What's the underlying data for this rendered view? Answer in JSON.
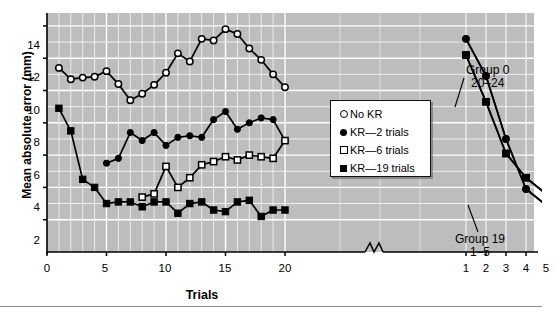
{
  "chart_data": {
    "type": "line",
    "title": "",
    "xlabel": "Trials",
    "ylabel": "Mean absolute error (mm)",
    "ylim": [
      0,
      14.8
    ],
    "yticks": [
      2,
      4,
      6,
      8,
      10,
      12,
      14
    ],
    "grid": true,
    "axis_break": true,
    "acquisition": {
      "xticks": [
        0,
        5,
        10,
        15,
        20
      ],
      "x": [
        1,
        2,
        3,
        4,
        5,
        6,
        7,
        8,
        9,
        10,
        11,
        12,
        13,
        14,
        15,
        16,
        17,
        18,
        19,
        20
      ]
    },
    "retention": {
      "xticks": [
        1,
        2,
        3,
        4,
        5
      ],
      "x": [
        1,
        2,
        3,
        4,
        5
      ]
    },
    "legend_position": "inside-right",
    "series": [
      {
        "name": "No KR",
        "marker": "open-circle",
        "acquisition": [
          11.4,
          10.7,
          10.8,
          10.85,
          11.2,
          10.4,
          9.4,
          9.8,
          10.35,
          11.1,
          12.3,
          11.8,
          13.2,
          13.1,
          13.8,
          13.5,
          12.6,
          11.9,
          11.0,
          10.2
        ],
        "retention": [
          13.2,
          10.9,
          7.0,
          3.9,
          2.9
        ]
      },
      {
        "name": "KR—2 trials",
        "marker": "filled-circle",
        "acquisition": [
          null,
          null,
          null,
          null,
          5.5,
          5.8,
          7.4,
          6.9,
          7.4,
          6.6,
          7.1,
          7.2,
          7.1,
          8.2,
          8.7,
          7.6,
          8.0,
          8.3,
          8.2,
          6.9
        ],
        "retention": [
          13.2,
          10.9,
          7.0,
          3.9,
          2.9
        ]
      },
      {
        "name": "KR—6 trials",
        "marker": "open-square",
        "acquisition": [
          null,
          null,
          null,
          null,
          null,
          null,
          null,
          3.4,
          3.6,
          5.3,
          4.0,
          4.6,
          5.4,
          5.6,
          5.9,
          5.7,
          6.0,
          5.9,
          5.8,
          6.9
        ],
        "retention": [
          12.2,
          9.3,
          6.1,
          4.6,
          3.6
        ]
      },
      {
        "name": "KR—19 trials",
        "marker": "filled-square",
        "acquisition": [
          8.9,
          7.5,
          4.5,
          4.0,
          3.0,
          3.1,
          3.1,
          2.8,
          3.1,
          3.1,
          2.4,
          3.0,
          3.1,
          2.6,
          2.5,
          3.1,
          3.2,
          2.2,
          2.6,
          2.6
        ],
        "retention": [
          12.2,
          9.3,
          6.1,
          4.6,
          3.6
        ]
      }
    ],
    "annotations": [
      {
        "id": "group-0",
        "line1": "Group 0",
        "line2": "20–24"
      },
      {
        "id": "group-19",
        "line1": "Group 19",
        "line2": "1–5"
      }
    ]
  },
  "axes": {
    "y_title": "Mean absolute error (mm)",
    "x_title": "Trials",
    "y_tick_labels": [
      "2",
      "4",
      "6",
      "8",
      "10",
      "12",
      "14"
    ],
    "x_tick_labels_left": [
      "0",
      "5",
      "10",
      "15",
      "20"
    ],
    "x_tick_labels_right": [
      "1",
      "2",
      "3",
      "4",
      "5"
    ]
  },
  "legend": {
    "items": [
      {
        "label": "No KR",
        "marker": "open-circle"
      },
      {
        "label": "KR—2 trials",
        "marker": "filled-circle"
      },
      {
        "label": "KR—6 trials",
        "marker": "open-square"
      },
      {
        "label": "KR—19 trials",
        "marker": "filled-square"
      }
    ]
  },
  "annotations": {
    "group0_line1": "Group 0",
    "group0_line2": "20–24",
    "group19_line1": "Group 19",
    "group19_line2": "1–5"
  },
  "colors": {
    "plot_background": "#bdbdbd",
    "grid": "#ffffff",
    "series_line": "#000000",
    "page_background": "#ffffff"
  }
}
